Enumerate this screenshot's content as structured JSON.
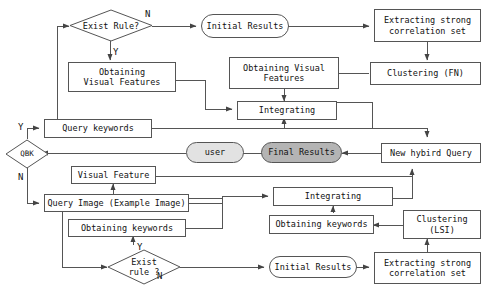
{
  "diagram": {
    "colors": {
      "line": "#555555",
      "node_fill": "#ffffff",
      "shade_light": "#e2e2e2",
      "shade_dark": "#b4b4b4",
      "text": "#111111",
      "background": "#ffffff"
    },
    "nodes": [
      {
        "id": "exist_rule_top",
        "label": "Exist Rule?",
        "shape": "diamond",
        "fill": "white"
      },
      {
        "id": "initial_results_top",
        "label": "Initial Results",
        "shape": "stadium",
        "fill": "white"
      },
      {
        "id": "extracting_top",
        "label": "Extracting strong\ncorrelation set",
        "shape": "rect",
        "fill": "white"
      },
      {
        "id": "clustering_fn",
        "label": "Clustering (FN)",
        "shape": "rect",
        "fill": "white"
      },
      {
        "id": "obtaining_vf_left",
        "label": "Obtaining\nVisual Features",
        "shape": "rect",
        "fill": "white"
      },
      {
        "id": "obtaining_vf_mid",
        "label": "Obtaining Visual\nFeatures",
        "shape": "rect",
        "fill": "white"
      },
      {
        "id": "integrating_top",
        "label": "Integrating",
        "shape": "rect",
        "fill": "white"
      },
      {
        "id": "query_keywords",
        "label": "Query keywords",
        "shape": "rect",
        "fill": "white"
      },
      {
        "id": "qbk",
        "label": "QBK",
        "shape": "diamond",
        "fill": "white"
      },
      {
        "id": "user",
        "label": "user",
        "shape": "stadium",
        "fill": "shade_light"
      },
      {
        "id": "final_results",
        "label": "Final Results",
        "shape": "stadium",
        "fill": "shade_dark"
      },
      {
        "id": "new_hybird_query",
        "label": "New hybird Query",
        "shape": "rect",
        "fill": "white"
      },
      {
        "id": "visual_feature",
        "label": "Visual Feature",
        "shape": "rect",
        "fill": "white"
      },
      {
        "id": "query_image",
        "label": "Query Image (Example Image)",
        "shape": "rect",
        "fill": "white"
      },
      {
        "id": "integrating_bottom",
        "label": "Integrating",
        "shape": "rect",
        "fill": "white"
      },
      {
        "id": "obtaining_keywords_left",
        "label": "Obtaining keywords",
        "shape": "rect",
        "fill": "white"
      },
      {
        "id": "obtaining_keywords_right",
        "label": "Obtaining keywords",
        "shape": "rect",
        "fill": "white"
      },
      {
        "id": "clustering_lsi",
        "label": "Clustering\n(LSI)",
        "shape": "rect",
        "fill": "white"
      },
      {
        "id": "exist_rule_bottom",
        "label": "Exist\nrule ?",
        "shape": "diamond",
        "fill": "white"
      },
      {
        "id": "initial_results_bottom",
        "label": "Initial Results",
        "shape": "stadium",
        "fill": "white"
      },
      {
        "id": "extracting_bottom",
        "label": "Extracting strong\ncorrelation set",
        "shape": "rect",
        "fill": "white"
      }
    ],
    "edge_labels": [
      {
        "id": "n_top",
        "text": "N"
      },
      {
        "id": "y_top",
        "text": "Y"
      },
      {
        "id": "y_qbk",
        "text": "Y"
      },
      {
        "id": "n_qbk",
        "text": "N"
      },
      {
        "id": "y_bottom",
        "text": "Y"
      },
      {
        "id": "n_bottom",
        "text": "N"
      }
    ]
  }
}
